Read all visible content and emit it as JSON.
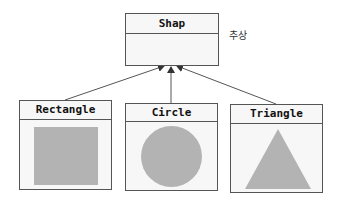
{
  "diagram": {
    "type": "class-inheritance",
    "parent": {
      "label": "Shap",
      "annotation": "추상"
    },
    "children": [
      {
        "label": "Rectangle",
        "shape": "rectangle"
      },
      {
        "label": "Circle",
        "shape": "circle"
      },
      {
        "label": "Triangle",
        "shape": "triangle"
      }
    ],
    "colors": {
      "shape_fill": "#b3b3b3",
      "box_fill": "#f7f7f7",
      "border": "#555555",
      "arrow": "#555555"
    }
  }
}
